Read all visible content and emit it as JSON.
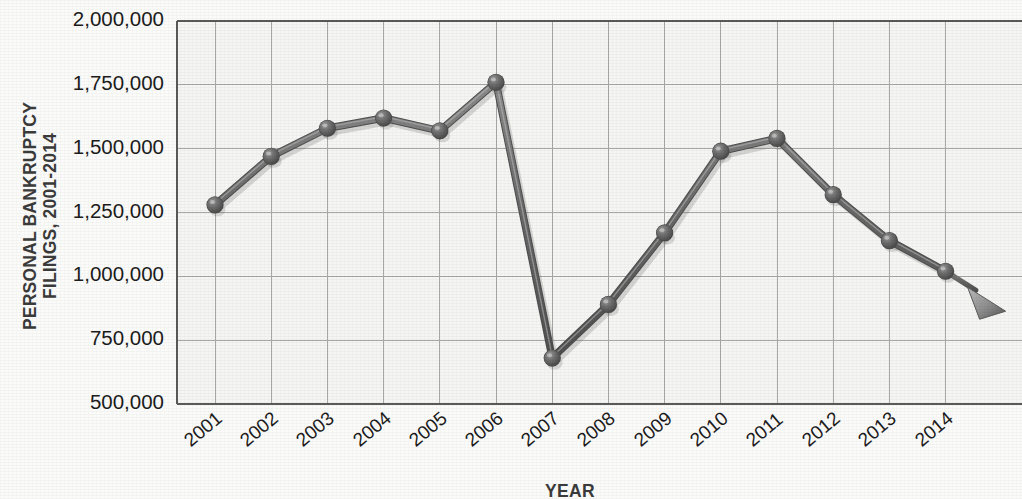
{
  "chart_data": {
    "type": "line",
    "title": "",
    "ylabel_line1": "PERSONAL BANKRUPTCY",
    "ylabel_line2": "FILINGS, 2001-2014",
    "xlabel": "YEAR",
    "categories": [
      "2001",
      "2002",
      "2003",
      "2004",
      "2005",
      "2006",
      "2007",
      "2008",
      "2009",
      "2010",
      "2011",
      "2012",
      "2013",
      "2014"
    ],
    "values": [
      1280000,
      1470000,
      1580000,
      1620000,
      1570000,
      1760000,
      680000,
      890000,
      1170000,
      1490000,
      1540000,
      1320000,
      1140000,
      1020000
    ],
    "ytick_labels": [
      "2,000,000",
      "1,750,000",
      "1,500,000",
      "1,250,000",
      "1,000,000",
      "750,000",
      "500,000"
    ],
    "ytick_values": [
      2000000,
      1750000,
      1500000,
      1250000,
      1000000,
      750000,
      500000
    ],
    "ylim": [
      500000,
      2000000
    ],
    "grid": true,
    "legend": "none",
    "series_color": "#5f5f5f",
    "marker_color": "#6a6a6a",
    "grid_color": "#a8a8a8",
    "axis_color": "#5a5a5a",
    "plot_background": "#f5f5f3",
    "has_trend_arrow": true,
    "arrow_direction": "down-right"
  }
}
